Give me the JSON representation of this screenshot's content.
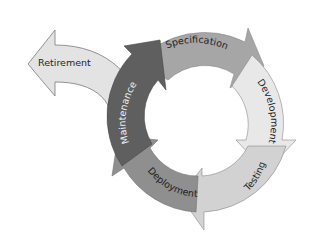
{
  "diagram": {
    "type": "cycle",
    "stages": [
      {
        "id": "specification",
        "label": "Specification",
        "color": "#a6a6a6"
      },
      {
        "id": "development",
        "label": "Development",
        "color": "#e8e8e8"
      },
      {
        "id": "testing",
        "label": "Testing",
        "color": "#d2d2d2"
      },
      {
        "id": "deployment",
        "label": "Deployment",
        "color": "#8f8f8f"
      },
      {
        "id": "maintenance",
        "label": "Maintenance",
        "color": "#5f5f5f"
      }
    ],
    "exit": {
      "id": "retirement",
      "label": "Retirement",
      "color": "#e3e3e3"
    }
  }
}
